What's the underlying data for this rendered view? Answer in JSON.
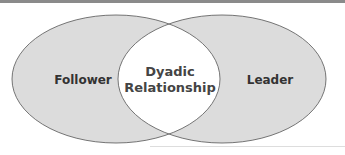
{
  "diagram": {
    "type": "venn",
    "left_set": {
      "label": "Follower"
    },
    "right_set": {
      "label": "Leader"
    },
    "intersection": {
      "line1": "Dyadic",
      "line2": "Relationship"
    },
    "colors": {
      "fill": "#dcdcdc",
      "stroke": "#555555",
      "intersection_fill": "#ffffff"
    }
  }
}
